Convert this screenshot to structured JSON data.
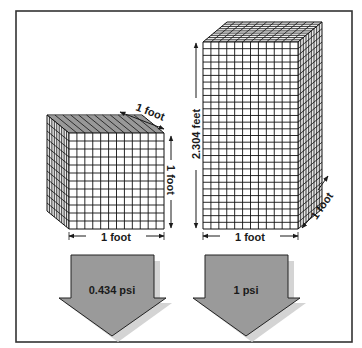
{
  "diagram": {
    "type": "pressure-comparison",
    "colors": {
      "frame": "#333333",
      "grid_line": "#111111",
      "face_fill": "#ffffff",
      "arrow_fill": "#9a9a9a",
      "arrow_shadow": "#d0d0d0",
      "text": "#1a1a1a"
    },
    "left_block": {
      "width_label": "1 foot",
      "height_label": "1 foot",
      "depth_label": "1 foot",
      "pressure_label": "0.434 psi",
      "grid_cols": 12,
      "grid_rows": 12
    },
    "right_block": {
      "width_label": "1 foot",
      "height_label": "2.304 feet",
      "depth_label": "1 foot",
      "pressure_label": "1 psi",
      "grid_cols": 12,
      "grid_rows": 28
    }
  }
}
